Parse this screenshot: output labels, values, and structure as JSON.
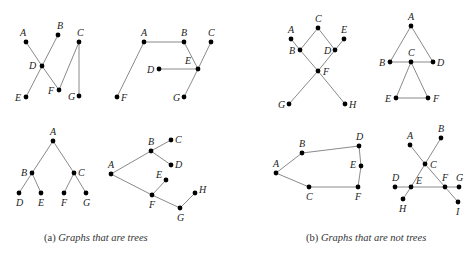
{
  "captions": {
    "a": {
      "prefix": "(a) ",
      "text": "Graphs that are trees"
    },
    "b": {
      "prefix": "(b) ",
      "text": "Graphs that are not trees"
    }
  },
  "graphs": [
    {
      "id": "tree-1",
      "group": "a",
      "nodes": [
        {
          "id": "A",
          "x": 26,
          "y": 42,
          "lx": -6,
          "ly": -6
        },
        {
          "id": "B",
          "x": 58,
          "y": 35,
          "lx": -1,
          "ly": -6
        },
        {
          "id": "C",
          "x": 79,
          "y": 42,
          "lx": -2,
          "ly": -6
        },
        {
          "id": "D",
          "x": 42,
          "y": 66,
          "lx": -13,
          "ly": 3
        },
        {
          "id": "E",
          "x": 26,
          "y": 97,
          "lx": -11,
          "ly": 4
        },
        {
          "id": "F",
          "x": 59,
          "y": 90,
          "lx": -11,
          "ly": 4
        },
        {
          "id": "G",
          "x": 79,
          "y": 96,
          "lx": -11,
          "ly": 4
        }
      ],
      "edges": [
        [
          "A",
          "D"
        ],
        [
          "D",
          "F"
        ],
        [
          "B",
          "D"
        ],
        [
          "D",
          "E"
        ],
        [
          "F",
          "C"
        ],
        [
          "C",
          "G"
        ]
      ]
    },
    {
      "id": "tree-2",
      "group": "a",
      "nodes": [
        {
          "id": "A",
          "x": 144,
          "y": 42,
          "lx": -3,
          "ly": -6
        },
        {
          "id": "B",
          "x": 184,
          "y": 42,
          "lx": -3,
          "ly": -6
        },
        {
          "id": "C",
          "x": 211,
          "y": 42,
          "lx": -3,
          "ly": -6
        },
        {
          "id": "D",
          "x": 159,
          "y": 69,
          "lx": -12,
          "ly": 4
        },
        {
          "id": "E",
          "x": 198,
          "y": 69,
          "lx": -13,
          "ly": -5
        },
        {
          "id": "F",
          "x": 117,
          "y": 97,
          "lx": 4,
          "ly": 4
        },
        {
          "id": "G",
          "x": 184,
          "y": 97,
          "lx": -11,
          "ly": 4
        }
      ],
      "edges": [
        [
          "A",
          "B"
        ],
        [
          "A",
          "F"
        ],
        [
          "B",
          "E"
        ],
        [
          "D",
          "E"
        ],
        [
          "E",
          "C"
        ],
        [
          "E",
          "G"
        ]
      ]
    },
    {
      "id": "tree-3",
      "group": "a",
      "nodes": [
        {
          "id": "A",
          "x": 53,
          "y": 141,
          "lx": -3,
          "ly": -6
        },
        {
          "id": "B",
          "x": 32,
          "y": 173,
          "lx": -11,
          "ly": 3
        },
        {
          "id": "C",
          "x": 74,
          "y": 173,
          "lx": 4,
          "ly": 3
        },
        {
          "id": "D",
          "x": 19,
          "y": 193,
          "lx": -3,
          "ly": 13
        },
        {
          "id": "E",
          "x": 41,
          "y": 193,
          "lx": -3,
          "ly": 13
        },
        {
          "id": "F",
          "x": 64,
          "y": 193,
          "lx": -3,
          "ly": 13
        },
        {
          "id": "G",
          "x": 86,
          "y": 193,
          "lx": -3,
          "ly": 13
        }
      ],
      "edges": [
        [
          "A",
          "B"
        ],
        [
          "A",
          "C"
        ],
        [
          "B",
          "D"
        ],
        [
          "B",
          "E"
        ],
        [
          "C",
          "F"
        ],
        [
          "C",
          "G"
        ]
      ]
    },
    {
      "id": "tree-4",
      "group": "a",
      "nodes": [
        {
          "id": "A",
          "x": 111,
          "y": 174,
          "lx": -3,
          "ly": -6
        },
        {
          "id": "B",
          "x": 151,
          "y": 151,
          "lx": -3,
          "ly": -6
        },
        {
          "id": "C",
          "x": 171,
          "y": 140,
          "lx": 4,
          "ly": 3
        },
        {
          "id": "D",
          "x": 171,
          "y": 165,
          "lx": 4,
          "ly": 3
        },
        {
          "id": "E",
          "x": 166,
          "y": 180,
          "lx": -10,
          "ly": -2
        },
        {
          "id": "F",
          "x": 152,
          "y": 195,
          "lx": -3,
          "ly": 13
        },
        {
          "id": "G",
          "x": 180,
          "y": 208,
          "lx": -3,
          "ly": 13
        },
        {
          "id": "H",
          "x": 195,
          "y": 193,
          "lx": 4,
          "ly": 0
        }
      ],
      "edges": [
        [
          "A",
          "B"
        ],
        [
          "B",
          "C"
        ],
        [
          "B",
          "D"
        ],
        [
          "A",
          "F"
        ],
        [
          "F",
          "E"
        ],
        [
          "F",
          "G"
        ],
        [
          "G",
          "H"
        ]
      ]
    },
    {
      "id": "nontree-1",
      "group": "b",
      "nodes": [
        {
          "id": "A",
          "x": 291,
          "y": 39,
          "lx": -3,
          "ly": -6
        },
        {
          "id": "B",
          "x": 300,
          "y": 50,
          "lx": -11,
          "ly": 4
        },
        {
          "id": "C",
          "x": 318,
          "y": 28,
          "lx": -3,
          "ly": -6
        },
        {
          "id": "D",
          "x": 335,
          "y": 50,
          "lx": -11,
          "ly": 4
        },
        {
          "id": "E",
          "x": 344,
          "y": 39,
          "lx": -3,
          "ly": -6
        },
        {
          "id": "F",
          "x": 318,
          "y": 71,
          "lx": 5,
          "ly": 4
        },
        {
          "id": "G",
          "x": 289,
          "y": 104,
          "lx": -11,
          "ly": 4
        },
        {
          "id": "H",
          "x": 345,
          "y": 104,
          "lx": 4,
          "ly": 4
        }
      ],
      "edges": [
        [
          "A",
          "B"
        ],
        [
          "B",
          "C"
        ],
        [
          "C",
          "D"
        ],
        [
          "D",
          "E"
        ],
        [
          "B",
          "F"
        ],
        [
          "D",
          "F"
        ],
        [
          "F",
          "G"
        ],
        [
          "F",
          "H"
        ]
      ]
    },
    {
      "id": "nontree-2",
      "group": "b",
      "nodes": [
        {
          "id": "A",
          "x": 411,
          "y": 26,
          "lx": -3,
          "ly": -6
        },
        {
          "id": "B",
          "x": 390,
          "y": 62,
          "lx": -11,
          "ly": 4
        },
        {
          "id": "C",
          "x": 411,
          "y": 62,
          "lx": -3,
          "ly": -6
        },
        {
          "id": "D",
          "x": 433,
          "y": 62,
          "lx": 4,
          "ly": 4
        },
        {
          "id": "E",
          "x": 396,
          "y": 98,
          "lx": -11,
          "ly": 4
        },
        {
          "id": "F",
          "x": 428,
          "y": 98,
          "lx": 5,
          "ly": 4
        }
      ],
      "edges": [
        [
          "A",
          "B"
        ],
        [
          "A",
          "D"
        ],
        [
          "B",
          "D"
        ],
        [
          "C",
          "E"
        ],
        [
          "C",
          "F"
        ],
        [
          "E",
          "F"
        ]
      ]
    },
    {
      "id": "nontree-3",
      "group": "b",
      "nodes": [
        {
          "id": "A",
          "x": 276,
          "y": 173,
          "lx": -3,
          "ly": -6
        },
        {
          "id": "B",
          "x": 302,
          "y": 153,
          "lx": -3,
          "ly": -6
        },
        {
          "id": "C",
          "x": 309,
          "y": 187,
          "lx": -3,
          "ly": 13
        },
        {
          "id": "D",
          "x": 359,
          "y": 146,
          "lx": -3,
          "ly": -6
        },
        {
          "id": "E",
          "x": 361,
          "y": 166,
          "lx": -11,
          "ly": 2
        },
        {
          "id": "F",
          "x": 358,
          "y": 187,
          "lx": -3,
          "ly": 13
        }
      ],
      "edges": [
        [
          "A",
          "B"
        ],
        [
          "B",
          "D"
        ],
        [
          "D",
          "E"
        ],
        [
          "E",
          "F"
        ],
        [
          "F",
          "C"
        ],
        [
          "C",
          "A"
        ]
      ]
    },
    {
      "id": "nontree-4",
      "group": "b",
      "nodes": [
        {
          "id": "A",
          "x": 410,
          "y": 145,
          "lx": -3,
          "ly": -6
        },
        {
          "id": "B",
          "x": 441,
          "y": 138,
          "lx": -3,
          "ly": -6
        },
        {
          "id": "C",
          "x": 425,
          "y": 164,
          "lx": 5,
          "ly": 4
        },
        {
          "id": "D",
          "x": 395,
          "y": 187,
          "lx": -3,
          "ly": -6
        },
        {
          "id": "E",
          "x": 411,
          "y": 187,
          "lx": 5,
          "ly": -3
        },
        {
          "id": "F",
          "x": 445,
          "y": 187,
          "lx": -3,
          "ly": -6
        },
        {
          "id": "G",
          "x": 459,
          "y": 187,
          "lx": -3,
          "ly": -6
        },
        {
          "id": "H",
          "x": 403,
          "y": 199,
          "lx": -4,
          "ly": 13
        },
        {
          "id": "I",
          "x": 458,
          "y": 202,
          "lx": -2,
          "ly": 13
        }
      ],
      "edges": [
        [
          "A",
          "C"
        ],
        [
          "C",
          "F"
        ],
        [
          "F",
          "I"
        ],
        [
          "B",
          "C"
        ],
        [
          "C",
          "E"
        ],
        [
          "E",
          "H"
        ],
        [
          "D",
          "E"
        ],
        [
          "E",
          "F"
        ],
        [
          "F",
          "G"
        ]
      ]
    }
  ]
}
